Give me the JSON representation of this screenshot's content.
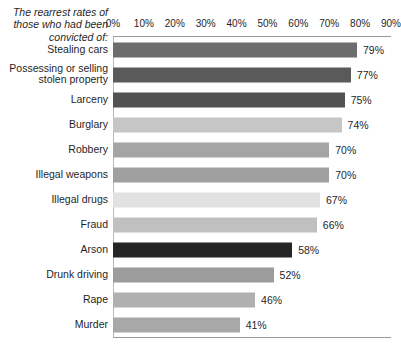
{
  "chart_data": {
    "type": "bar",
    "orientation": "horizontal",
    "title": "The rearrest rates\nof those who had\nbeen convicted of:",
    "xlabel": "",
    "ylabel": "",
    "xlim": [
      0,
      90
    ],
    "grid": false,
    "legend": false,
    "tick_labels": [
      "0%",
      "10%",
      "20%",
      "30%",
      "40%",
      "50%",
      "60%",
      "70%",
      "80%",
      "90%"
    ],
    "tick_values": [
      0,
      10,
      20,
      30,
      40,
      50,
      60,
      70,
      80,
      90
    ],
    "categories": [
      "Stealing cars",
      "Possessing or selling\nstolen property",
      "Larceny",
      "Burglary",
      "Robbery",
      "Illegal weapons",
      "Illegal drugs",
      "Fraud",
      "Arson",
      "Drunk driving",
      "Rape",
      "Murder"
    ],
    "values": [
      79,
      77,
      75,
      74,
      70,
      70,
      67,
      66,
      58,
      52,
      46,
      41
    ],
    "value_labels": [
      "79%",
      "77%",
      "75%",
      "74%",
      "70%",
      "70%",
      "67%",
      "66%",
      "58%",
      "52%",
      "46%",
      "41%"
    ],
    "bar_colors": [
      "#6d6d6d",
      "#5a5a5a",
      "#525252",
      "#c6c6c6",
      "#a5a5a5",
      "#a0a0a0",
      "#e2e2e2",
      "#c0c0c0",
      "#252525",
      "#9c9c9c",
      "#b0b0b0",
      "#a8a8a8"
    ]
  },
  "colors": {
    "background": "#ffffff",
    "axis_line": "#9a9a9a",
    "text": "#1f1f1f"
  }
}
